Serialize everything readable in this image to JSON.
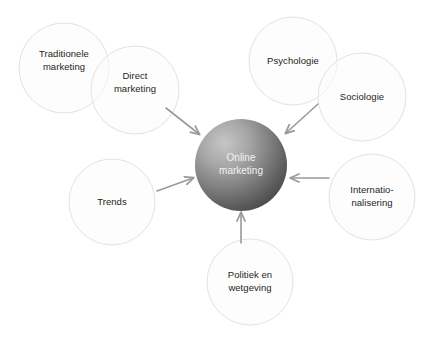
{
  "diagram": {
    "type": "hub-and-spoke",
    "title_visible": false,
    "background_color": "#ffffff",
    "core": {
      "label": "Online\nmarketing",
      "text_color": "#f2f2f2",
      "fill_dark": "#4d4d4d",
      "fill_light": "#b3b3b3",
      "cx": 241,
      "cy": 165,
      "r": 46
    },
    "satellite_style": {
      "stroke_color": "#e2e2e2",
      "fill_color": "#fcfcfc",
      "text_color": "#231f20",
      "radius": 43
    },
    "satellites": [
      {
        "id": "traditionele-marketing",
        "label": "Traditionele\nmarketing",
        "cx": 64,
        "cy": 68,
        "r": 45
      },
      {
        "id": "direct-marketing",
        "label": "Direct\nmarketing",
        "cx": 135,
        "cy": 90,
        "r": 44
      },
      {
        "id": "psychologie",
        "label": "Psychologie",
        "cx": 293,
        "cy": 61,
        "r": 44
      },
      {
        "id": "sociologie",
        "label": "Sociologie",
        "cx": 362,
        "cy": 97,
        "r": 44
      },
      {
        "id": "internationalisering",
        "label": "Internatio-\nnalisering",
        "cx": 372,
        "cy": 197,
        "r": 43
      },
      {
        "id": "politiek-en-wetgeving",
        "label": "Politiek en\nwetgeving",
        "cx": 250,
        "cy": 282,
        "r": 43
      },
      {
        "id": "trends",
        "label": "Trends",
        "cx": 112,
        "cy": 202,
        "r": 43
      }
    ],
    "arrows": [
      {
        "id": "arrow-from-direct-marketing",
        "direction": "down-right",
        "color": "#9a9a9a",
        "x1": 166,
        "y1": 108,
        "x2": 199,
        "y2": 134
      },
      {
        "id": "arrow-from-sociologie",
        "direction": "down-left",
        "color": "#9a9a9a",
        "x1": 318,
        "y1": 104,
        "x2": 286,
        "y2": 133
      },
      {
        "id": "arrow-from-trends",
        "direction": "right",
        "color": "#9a9a9a",
        "x1": 157,
        "y1": 191,
        "x2": 193,
        "y2": 178
      },
      {
        "id": "arrow-from-internationalisering",
        "direction": "left",
        "color": "#9a9a9a",
        "x1": 329,
        "y1": 178,
        "x2": 291,
        "y2": 178
      },
      {
        "id": "arrow-from-politiek",
        "direction": "up",
        "color": "#9a9a9a",
        "x1": 241,
        "y1": 243,
        "x2": 241,
        "y2": 213
      }
    ]
  }
}
